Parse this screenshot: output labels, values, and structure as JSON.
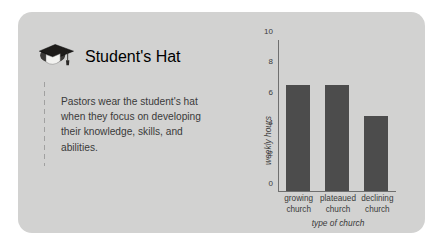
{
  "card": {
    "title": "Student's Hat",
    "icon": "graduation-cap-icon",
    "body_text": "Pastors wear the student's hat when they focus on developing their knowledge, skills, and abilities.",
    "background_color": "#d2d2d1"
  },
  "chart_data": {
    "type": "bar",
    "title": "",
    "categories": [
      "growing church",
      "plateaued church",
      "declining church"
    ],
    "category_lines": [
      [
        "growing",
        "church"
      ],
      [
        "plateaued",
        "church"
      ],
      [
        "declining",
        "church"
      ]
    ],
    "values": [
      7,
      7,
      5
    ],
    "xlabel": "type of church",
    "ylabel": "weekly hours",
    "ylim": [
      0,
      10
    ],
    "yticks": [
      0,
      2,
      4,
      6,
      8,
      10
    ],
    "ytick_labels": [
      "0",
      "2",
      "4",
      "6",
      "8",
      "10"
    ],
    "grid": false,
    "legend": false,
    "bar_color": "#4c4c4c",
    "axis_color": "#6f6f6f"
  }
}
